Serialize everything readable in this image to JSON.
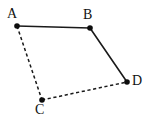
{
  "figure": {
    "kind": "geometry-quadrilateral",
    "background_color": "#ffffff",
    "stroke_color": "#1a1a1a",
    "vertex_color": "#0d0d0d",
    "canvas": {
      "width": 150,
      "height": 126
    },
    "vertices": [
      {
        "id": "A",
        "label": "A",
        "x": 17,
        "y": 26,
        "label_x": 7,
        "label_y": 7,
        "dot_radius": 2.8
      },
      {
        "id": "B",
        "label": "B",
        "x": 90,
        "y": 28,
        "label_x": 83,
        "label_y": 8,
        "dot_radius": 2.8
      },
      {
        "id": "C",
        "label": "C",
        "x": 42,
        "y": 100,
        "label_x": 35,
        "label_y": 103,
        "dot_radius": 2.8
      },
      {
        "id": "D",
        "label": "D",
        "x": 127,
        "y": 82,
        "label_x": 132,
        "label_y": 74,
        "dot_radius": 2.8
      }
    ],
    "edges": [
      {
        "id": "AB",
        "from": "A",
        "to": "B",
        "style": "solid",
        "x1": 17,
        "y1": 26,
        "x2": 90,
        "y2": 28
      },
      {
        "id": "BD",
        "from": "B",
        "to": "D",
        "style": "solid",
        "x1": 90,
        "y1": 28,
        "x2": 127,
        "y2": 82
      },
      {
        "id": "AC",
        "from": "A",
        "to": "C",
        "style": "dashed",
        "x1": 17,
        "y1": 26,
        "x2": 42,
        "y2": 100
      },
      {
        "id": "CD",
        "from": "C",
        "to": "D",
        "style": "dashed",
        "x1": 42,
        "y1": 100,
        "x2": 127,
        "y2": 82
      }
    ]
  }
}
